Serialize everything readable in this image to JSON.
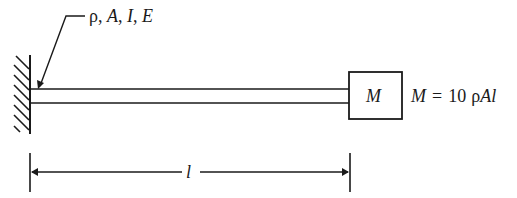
{
  "diagram": {
    "type": "cantilever-beam-with-tip-mass",
    "beam_properties_label": "ρ, A, I, E",
    "beam_properties": [
      "ρ",
      "A",
      "I",
      "E"
    ],
    "tip_mass_label": "M",
    "mass_equation": "M = 10 ρAl",
    "mass_equation_parts": {
      "lhs": "M",
      "eq": "=",
      "coef": "10",
      "rho": "ρ",
      "rest": "Al"
    },
    "length_label": "l",
    "support": "fixed-wall",
    "colors": {
      "ink": "#1a1a1a",
      "background": "#ffffff"
    }
  }
}
